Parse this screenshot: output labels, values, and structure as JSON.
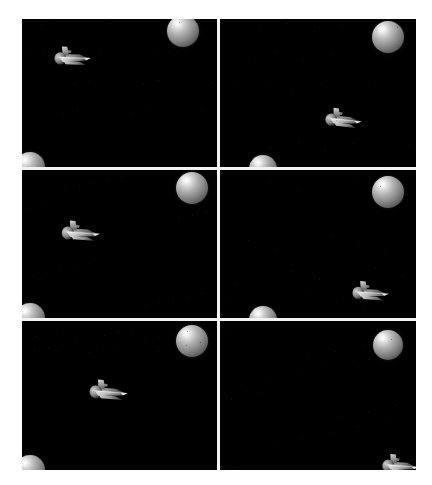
{
  "scene": {
    "title": "Space shuttle rendering montage",
    "background_color": "#ffffff",
    "panel_background_color": "#000000",
    "divider_color": "#f2f2f2",
    "montage": {
      "x": 22,
      "y": 19,
      "width": 394,
      "height": 451
    },
    "grid": {
      "columns": 2,
      "rows": 3,
      "panel_count": 6
    }
  },
  "panels": [
    {
      "id": "panel-1",
      "label": "top-left",
      "position": {
        "col": 0,
        "row": 0
      },
      "objects": [
        {
          "type": "sphere",
          "name": "planet-sphere",
          "cx": 161,
          "cy": 12,
          "r": 16,
          "clipped": "top"
        },
        {
          "type": "sphere",
          "name": "planet-sphere",
          "cx": 8,
          "cy": 148,
          "r": 15,
          "clipped": "bottom-left"
        },
        {
          "type": "shuttle",
          "name": "space-shuttle",
          "cx": 49,
          "cy": 36,
          "scale": 1.0,
          "rotation": -18
        }
      ]
    },
    {
      "id": "panel-2",
      "label": "top-right",
      "position": {
        "col": 1,
        "row": 0
      },
      "objects": [
        {
          "type": "sphere",
          "name": "planet-sphere",
          "cx": 167,
          "cy": 18,
          "r": 16,
          "clipped": "none"
        },
        {
          "type": "sphere",
          "name": "planet-sphere",
          "cx": 42,
          "cy": 150,
          "r": 14,
          "clipped": "bottom"
        },
        {
          "type": "shuttle",
          "name": "space-shuttle",
          "cx": 121,
          "cy": 98,
          "scale": 1.0,
          "rotation": -14
        }
      ]
    },
    {
      "id": "panel-3",
      "label": "middle-left",
      "position": {
        "col": 0,
        "row": 1
      },
      "objects": [
        {
          "type": "sphere",
          "name": "planet-sphere",
          "cx": 170,
          "cy": 18,
          "r": 16,
          "clipped": "none"
        },
        {
          "type": "sphere",
          "name": "planet-sphere",
          "cx": 8,
          "cy": 148,
          "r": 15,
          "clipped": "bottom-left"
        },
        {
          "type": "shuttle",
          "name": "space-shuttle",
          "cx": 57,
          "cy": 60,
          "scale": 1.05,
          "rotation": -16
        }
      ]
    },
    {
      "id": "panel-4",
      "label": "middle-right",
      "position": {
        "col": 1,
        "row": 1
      },
      "objects": [
        {
          "type": "sphere",
          "name": "planet-sphere",
          "cx": 167,
          "cy": 22,
          "r": 16,
          "clipped": "none"
        },
        {
          "type": "sphere",
          "name": "planet-sphere",
          "cx": 42,
          "cy": 150,
          "r": 14,
          "clipped": "bottom"
        },
        {
          "type": "shuttle",
          "name": "space-shuttle",
          "cx": 148,
          "cy": 120,
          "scale": 1.0,
          "rotation": -16
        }
      ]
    },
    {
      "id": "panel-5",
      "label": "bottom-left",
      "position": {
        "col": 0,
        "row": 2
      },
      "objects": [
        {
          "type": "sphere",
          "name": "planet-sphere",
          "cx": 170,
          "cy": 20,
          "r": 16,
          "clipped": "none"
        },
        {
          "type": "sphere",
          "name": "planet-sphere",
          "cx": 8,
          "cy": 149,
          "r": 15,
          "clipped": "bottom-left"
        },
        {
          "type": "shuttle",
          "name": "space-shuttle",
          "cx": 85,
          "cy": 68,
          "scale": 1.05,
          "rotation": -15
        }
      ]
    },
    {
      "id": "panel-6",
      "label": "bottom-right",
      "position": {
        "col": 1,
        "row": 2
      },
      "objects": [
        {
          "type": "sphere",
          "name": "planet-sphere",
          "cx": 167,
          "cy": 24,
          "r": 15,
          "clipped": "none"
        },
        {
          "type": "shuttle",
          "name": "space-shuttle",
          "cx": 178,
          "cy": 142,
          "scale": 1.0,
          "rotation": -15
        }
      ]
    }
  ],
  "chart_data": {
    "type": "table",
    "columns": [
      "panel",
      "object",
      "cx",
      "cy",
      "radius_or_scale"
    ],
    "rows": [
      [
        "top-left",
        "sphere",
        161,
        12,
        16
      ],
      [
        "top-left",
        "sphere",
        8,
        148,
        15
      ],
      [
        "top-left",
        "shuttle",
        49,
        36,
        1.0
      ],
      [
        "top-right",
        "sphere",
        167,
        18,
        16
      ],
      [
        "top-right",
        "sphere",
        42,
        150,
        14
      ],
      [
        "top-right",
        "shuttle",
        121,
        98,
        1.0
      ],
      [
        "middle-left",
        "sphere",
        170,
        18,
        16
      ],
      [
        "middle-left",
        "sphere",
        8,
        148,
        15
      ],
      [
        "middle-left",
        "shuttle",
        57,
        60,
        1.05
      ],
      [
        "middle-right",
        "sphere",
        167,
        22,
        16
      ],
      [
        "middle-right",
        "sphere",
        42,
        150,
        14
      ],
      [
        "middle-right",
        "shuttle",
        148,
        120,
        1.0
      ],
      [
        "bottom-left",
        "sphere",
        170,
        20,
        16
      ],
      [
        "bottom-left",
        "sphere",
        8,
        149,
        15
      ],
      [
        "bottom-left",
        "shuttle",
        85,
        68,
        1.05
      ],
      [
        "bottom-right",
        "sphere",
        167,
        24,
        15
      ],
      [
        "bottom-right",
        "shuttle",
        178,
        142,
        1.0
      ]
    ]
  }
}
